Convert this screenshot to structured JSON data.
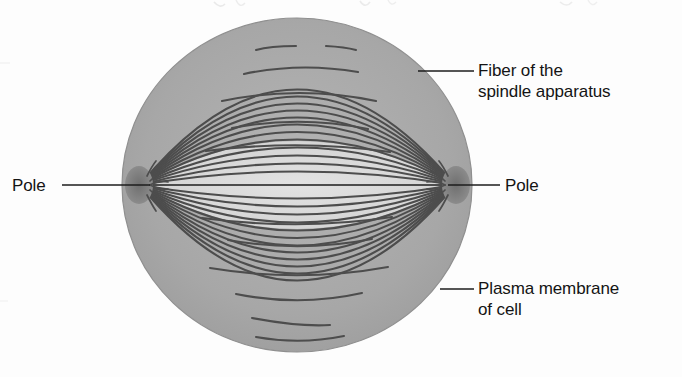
{
  "figure": {
    "type": "biological-diagram",
    "background_color": "#fdfdfd"
  },
  "cell": {
    "name": "cell",
    "shape": "ellipse",
    "center_x": 297,
    "center_y": 185,
    "radius_x": 175,
    "radius_y": 167,
    "cytoplasm_color": "#a9a9a9",
    "spindle_region_color": "#dcdcdc",
    "membrane_outline_color": "#8c8c8c"
  },
  "spindle": {
    "name": "spindle apparatus",
    "fiber_color": "#4a4a4a",
    "fiber_count": 26,
    "lens_half_height": 88,
    "pole_left_x": 140,
    "pole_right_x": 455,
    "pole_y": 185,
    "pole_color": "#7a7a7a"
  },
  "poles": [
    {
      "id": "pole-left",
      "label": "Pole",
      "x": 140,
      "y": 185
    },
    {
      "id": "pole-right",
      "label": "Pole",
      "x": 455,
      "y": 185
    }
  ],
  "labels": {
    "fiber": {
      "text": "Fiber of the\nspindle apparatus",
      "leader_from_x": 418,
      "leader_from_y": 71,
      "leader_to_x": 474,
      "leader_to_y": 71
    },
    "plasma_membrane": {
      "text": "Plasma membrane\nof cell",
      "leader_from_x": 440,
      "leader_from_y": 289,
      "leader_to_x": 474,
      "leader_to_y": 289
    },
    "pole_left": {
      "text": "Pole",
      "leader_from_x": 62,
      "leader_from_y": 185,
      "leader_to_x": 150,
      "leader_to_y": 185
    },
    "pole_right": {
      "text": "Pole",
      "leader_from_x": 448,
      "leader_from_y": 185,
      "leader_to_x": 500,
      "leader_to_y": 185
    }
  },
  "colors": {
    "line": "#1c1c1c",
    "text": "#141414",
    "fiber": "#4a4a4a",
    "cytoplasm": "#a9a9a9",
    "spindle_lens": "#dcdcdc"
  }
}
